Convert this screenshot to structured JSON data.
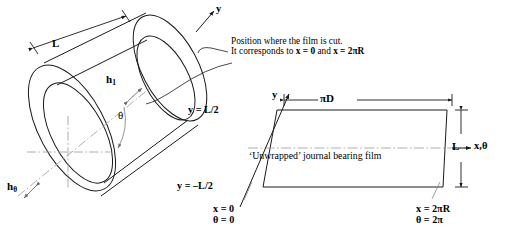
{
  "figure": {
    "title_alt": "Unwrapped journal bearing film diagram",
    "colors": {
      "line": "#1a1a1a",
      "centerline": "#8a8a8a",
      "background": "#ffffff"
    }
  },
  "cylinder": {
    "length_label": "L",
    "film_thickness_top_label": "h",
    "film_thickness_top_sub": "1",
    "film_thickness_angle_label": "h",
    "film_thickness_angle_sub": "θ",
    "angle_label": "θ",
    "axis_y_label": "y"
  },
  "callout": {
    "line1": "Position where the film is cut.",
    "line2_pre": "It corresponds to ",
    "line2_eq1": "x = 0",
    "line2_mid": " and ",
    "line2_eq2": "x = 2πR"
  },
  "unwrapped": {
    "axis_y_label": "y",
    "axis_x_label": "x,θ",
    "top_edge_label": "y = L/2",
    "bottom_edge_label": "y = –L/2",
    "width_dimension": "πD",
    "height_dimension": "L",
    "body_text": "‘Unwrapped’ journal bearing film",
    "left_corner": {
      "line1": "x = 0",
      "line2": "θ = 0"
    },
    "right_corner": {
      "line1": "x = 2πR",
      "line2": "θ = 2π"
    }
  }
}
